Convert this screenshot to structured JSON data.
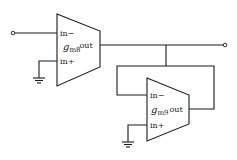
{
  "diagram": {
    "type": "circuit-schematic",
    "amplifiers": [
      {
        "id": "gm8",
        "symbol_main": "g",
        "symbol_sub": "m8",
        "pins": {
          "inverting": "in−",
          "noninverting": "in+",
          "output": "out"
        }
      },
      {
        "id": "gm9",
        "symbol_main": "g",
        "symbol_sub": "m9",
        "pins": {
          "inverting": "in−",
          "noninverting": "in+",
          "output": "out"
        }
      }
    ],
    "connections": [
      "input terminal -> gm8 in-",
      "gm8 in+ -> ground",
      "gm8 out -> output terminal",
      "gm8 out -> gm9 in-",
      "gm9 out -> gm9 in- (feedback)",
      "gm9 in+ -> ground"
    ],
    "colors": {
      "line": "#1a1a1a",
      "background": "#ffffff"
    }
  }
}
